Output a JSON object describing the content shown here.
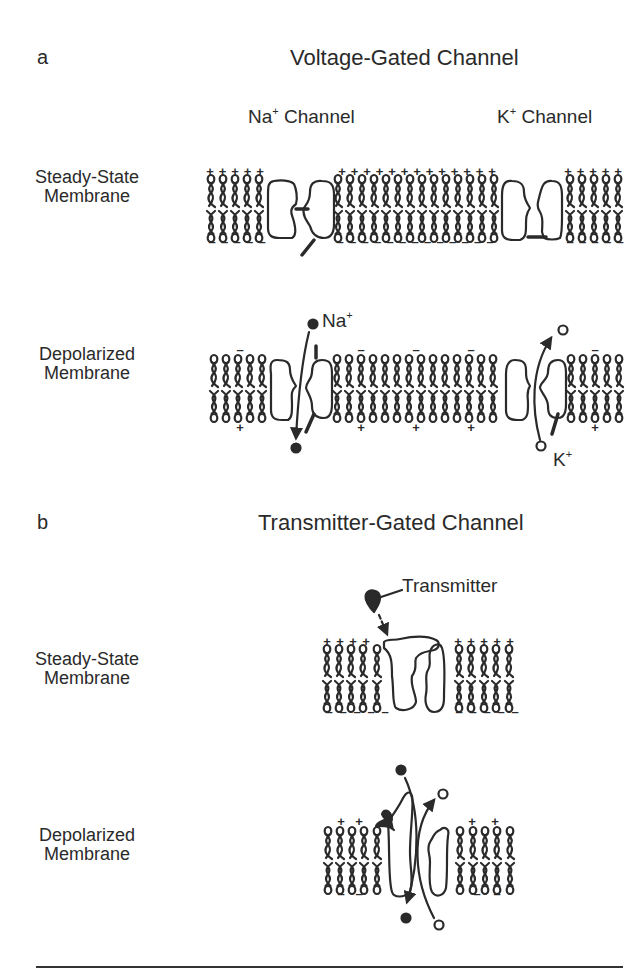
{
  "panel_a": {
    "letter": "a",
    "title": "Voltage-Gated Channel",
    "channels": [
      {
        "label_main": "Na",
        "label_sup": "+",
        "label_rest": " Channel"
      },
      {
        "label_main": "K",
        "label_sup": "+",
        "label_rest": " Channel"
      }
    ],
    "rows": [
      {
        "label_line1": "Steady-State",
        "label_line2": "Membrane"
      },
      {
        "label_line1": "Depolarized",
        "label_line2": "Membrane"
      }
    ],
    "ions": {
      "na": {
        "main": "Na",
        "sup": "+",
        "marker": "filled-circle"
      },
      "k": {
        "main": "K",
        "sup": "+",
        "marker": "open-circle"
      }
    }
  },
  "panel_b": {
    "letter": "b",
    "title": "Transmitter-Gated Channel",
    "transmitter_label": "Transmitter",
    "rows": [
      {
        "label_line1": "Steady-State",
        "label_line2": "Membrane"
      },
      {
        "label_line1": "Depolarized",
        "label_line2": "Membrane"
      }
    ]
  },
  "charges": {
    "outside_steady": "+",
    "inside_steady": "-",
    "outside_depolarized": "-",
    "inside_depolarized": "+"
  },
  "colors": {
    "ink": "#2a2a2a",
    "background": "#ffffff"
  }
}
